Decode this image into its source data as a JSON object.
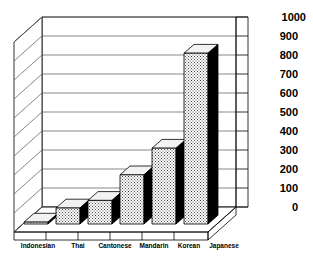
{
  "chart_data": {
    "type": "bar",
    "title": "",
    "subtitle": "",
    "xlabel": "",
    "ylabel": "",
    "categories": [
      "Indonesian",
      "Thai",
      "Cantonese",
      "Mandarin",
      "Korean",
      "Japanese"
    ],
    "values": [
      10,
      75,
      115,
      250,
      390,
      890
    ],
    "series": [
      {
        "name": "",
        "values": [
          10,
          75,
          115,
          250,
          390,
          890
        ]
      }
    ],
    "ylim": [
      0,
      1000
    ],
    "ytick_step": 100,
    "yticks": [
      0,
      100,
      200,
      300,
      400,
      500,
      600,
      700,
      800,
      900,
      1000
    ],
    "ytick_labels": [
      "0",
      "100",
      "200",
      "300",
      "400",
      "500",
      "600",
      "700",
      "800",
      "900",
      "1000"
    ],
    "grid": true,
    "grid_axis": "y",
    "legend": false,
    "legend_position": "none",
    "style": "3d-perspective",
    "annotations": []
  },
  "colors": {
    "bar_front": "#f0f0f0",
    "bar_side": "#000000",
    "bar_top": "#f2f2f2",
    "outline": "#000000",
    "grid": "#555555",
    "background": "#ffffff",
    "wall": "#ffffff",
    "text": "#000000"
  },
  "axes": {
    "y_axis_position": "right",
    "x_axis_position": "bottom"
  }
}
